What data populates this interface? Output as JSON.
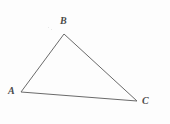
{
  "figure": {
    "name": "triangle-abc",
    "caption": "",
    "background_color": "#fdfdfd",
    "stroke_color": "#6a6a6a",
    "stroke_width": 1,
    "label_color": "#4a4a4a",
    "width": 170,
    "height": 124
  },
  "chart_data": {
    "type": "diagram",
    "shape": "triangle",
    "title": "",
    "xlabel": "",
    "ylabel": "",
    "vertices": [
      {
        "id": "A",
        "label": "A",
        "x": 21,
        "y": 92,
        "label_x": 10,
        "label_y": 93
      },
      {
        "id": "B",
        "label": "B",
        "x": 64,
        "y": 34,
        "label_x": 62,
        "label_y": 23
      },
      {
        "id": "C",
        "label": "C",
        "x": 137,
        "y": 101,
        "label_x": 144,
        "label_y": 103
      }
    ],
    "edges": [
      {
        "from": "A",
        "to": "B",
        "label": ""
      },
      {
        "from": "B",
        "to": "C",
        "label": ""
      },
      {
        "from": "C",
        "to": "A",
        "label": ""
      }
    ],
    "polygon_points": "21,92 64,34 137,101"
  },
  "labels": {
    "a": "A",
    "b": "B",
    "c": "C"
  }
}
